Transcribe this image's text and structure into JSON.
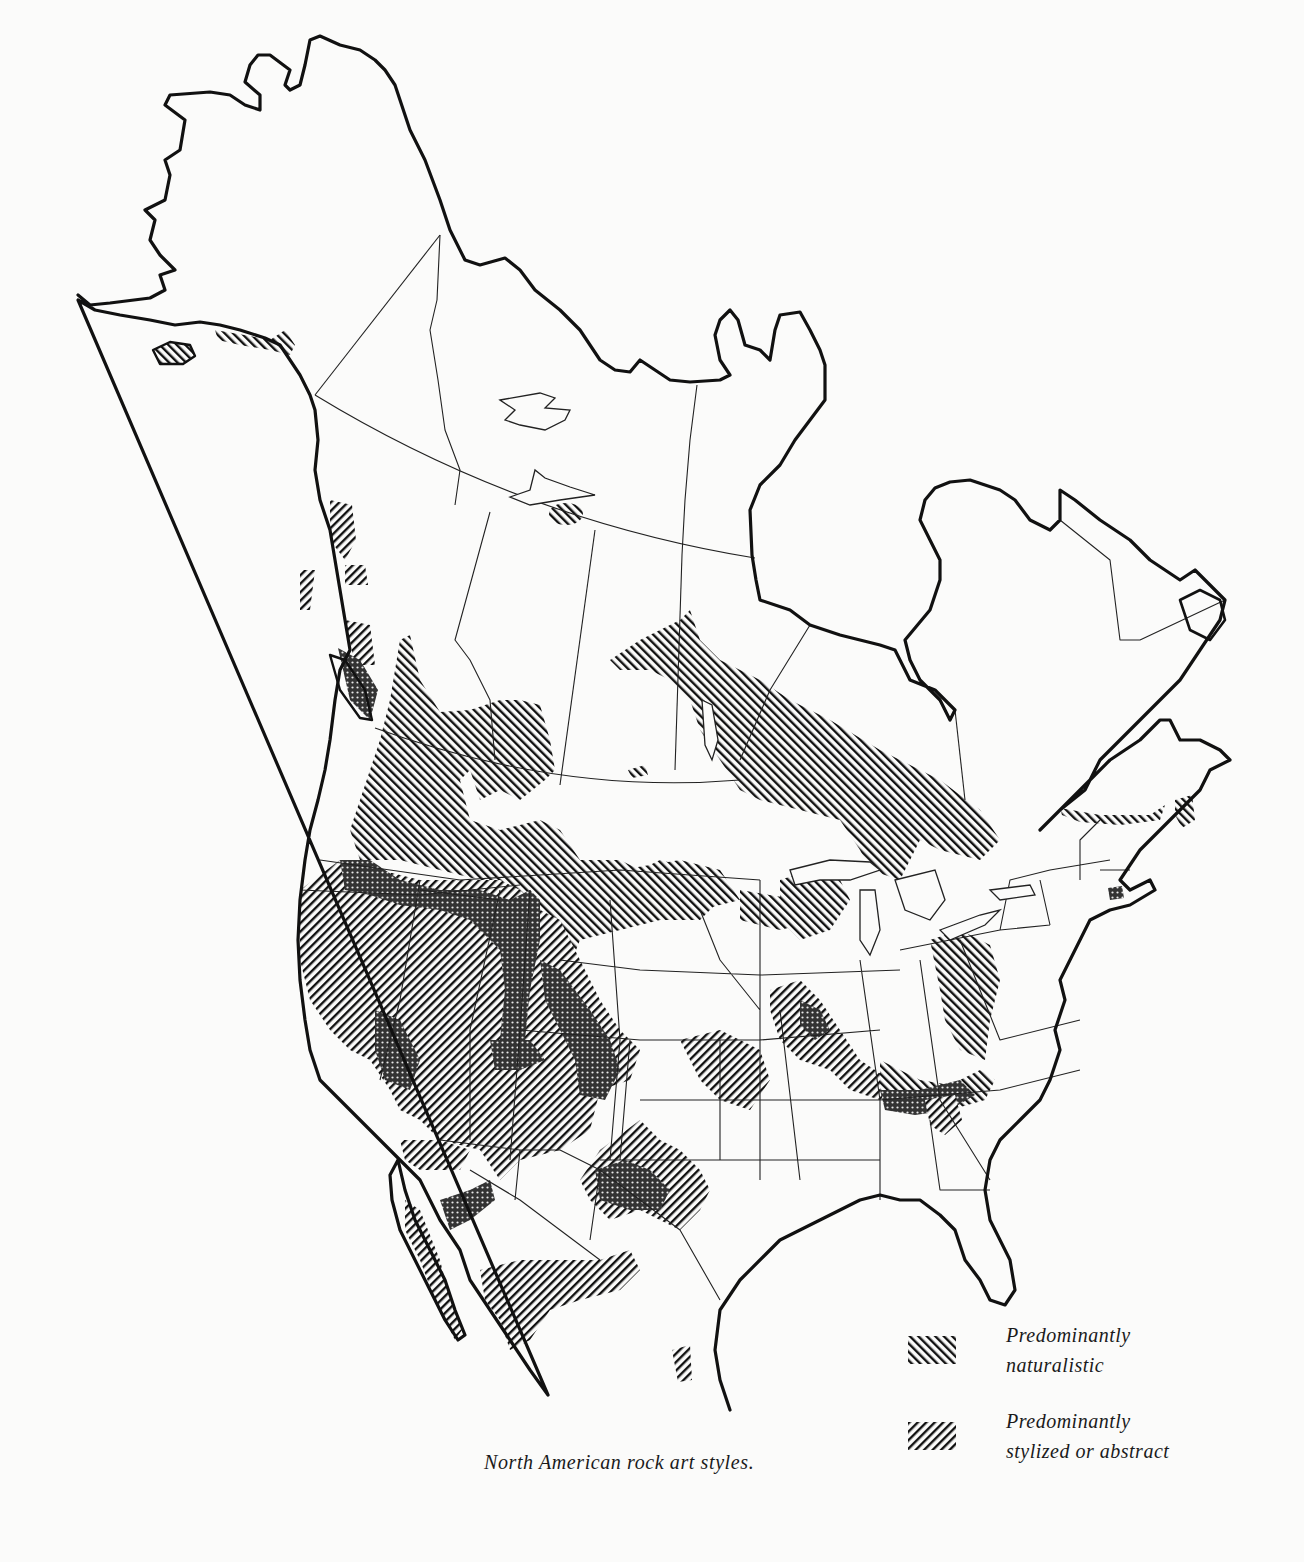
{
  "caption": "North American rock art styles.",
  "legend": {
    "items": [
      {
        "key": "naturalistic",
        "line1": "Predominantly",
        "line2": "naturalistic",
        "pattern": "hatch-forward-slash"
      },
      {
        "key": "stylized",
        "line1": "Predominantly",
        "line2": "stylized or abstract",
        "pattern": "hatch-back-slash"
      }
    ]
  },
  "map": {
    "region": "North America",
    "colors": {
      "ink": "#111111",
      "paper": "#fbfbfa"
    },
    "zones": [
      {
        "name": "Alaska / Kodiak",
        "style": "naturalistic"
      },
      {
        "name": "Great Slave Lake",
        "style": "naturalistic"
      },
      {
        "name": "Northwest Coast",
        "style": "mixed"
      },
      {
        "name": "Columbia Plateau",
        "style": "naturalistic"
      },
      {
        "name": "Great Plains / Northern Plains",
        "style": "naturalistic"
      },
      {
        "name": "Canadian Shield",
        "style": "naturalistic"
      },
      {
        "name": "Great Basin & California",
        "style": "stylized or abstract"
      },
      {
        "name": "Southwest",
        "style": "mixed"
      },
      {
        "name": "Texas / Pecos",
        "style": "mixed"
      },
      {
        "name": "Baja California",
        "style": "mixed"
      },
      {
        "name": "Northern Mexico",
        "style": "stylized or abstract"
      },
      {
        "name": "Ohio & Mississippi Valley",
        "style": "mixed"
      },
      {
        "name": "Southern Appalachians",
        "style": "mixed"
      },
      {
        "name": "New England / Maritimes",
        "style": "naturalistic"
      }
    ]
  }
}
